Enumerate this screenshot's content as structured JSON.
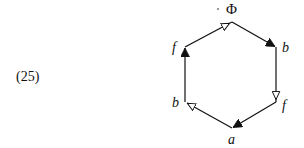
{
  "equation": {
    "number": "(25)"
  },
  "diagram": {
    "type": "hexagon-cycle",
    "vertices": [
      {
        "id": "top",
        "label": "Φ",
        "x": 232,
        "y": 22
      },
      {
        "id": "upper-right",
        "label": "b",
        "x": 276,
        "y": 47
      },
      {
        "id": "lower-right",
        "label": "f",
        "x": 276,
        "y": 102
      },
      {
        "id": "bottom",
        "label": "a",
        "x": 232,
        "y": 128
      },
      {
        "id": "lower-left",
        "label": "b",
        "x": 185,
        "y": 102
      },
      {
        "id": "upper-left",
        "label": "f",
        "x": 185,
        "y": 47
      }
    ],
    "edges": [
      {
        "from": "top",
        "to": "upper-right",
        "arrow": "filled"
      },
      {
        "from": "upper-right",
        "to": "lower-right",
        "arrow": "open"
      },
      {
        "from": "lower-right",
        "to": "bottom",
        "arrow": "filled"
      },
      {
        "from": "bottom",
        "to": "lower-left",
        "arrow": "open"
      },
      {
        "from": "lower-left",
        "to": "upper-left",
        "arrow": "filled"
      },
      {
        "from": "upper-left",
        "to": "top",
        "arrow": "open"
      }
    ],
    "colors": {
      "line": "#111111",
      "filled_arrow": "#111111",
      "open_arrow_fill": "#ffffff"
    }
  }
}
